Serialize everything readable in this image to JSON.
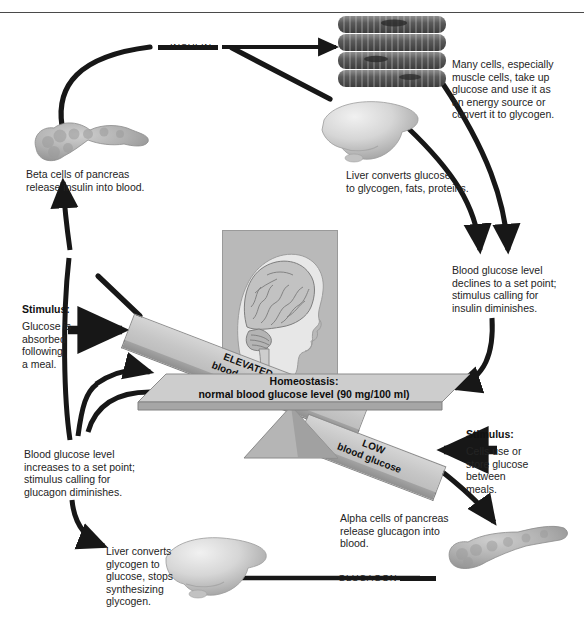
{
  "figure": {
    "top_rule": true
  },
  "hormone_labels": {
    "insulin": "INSULIN",
    "glucagon": "GLUCAGON"
  },
  "balance": {
    "homeostasis_line1": "Homeostasis:",
    "homeostasis_line2": "normal blood glucose level (90 mg/100 ml)",
    "elevated_line1": "ELEVATED",
    "elevated_line2": "blood glucose",
    "low_line1": "LOW",
    "low_line2": "blood glucose",
    "set_point_value": "90 mg/100 ml"
  },
  "stimuli": {
    "top": {
      "heading": "Stimulus:",
      "body": "Glucose is\nabsorbed\nfollowing\na meal."
    },
    "bottom": {
      "heading": "Stimulus:",
      "body": "Cells use or\nstore glucose\nbetween\nmeals."
    }
  },
  "captions": {
    "beta_cells": "Beta cells of pancreas\nrelease insulin into blood.",
    "muscle_uptake": "Many cells, especially\nmuscle cells, take up\nglucose and use it as\nan energy source or\nconvert it to glycogen.",
    "liver_stores": "Liver converts glucose\nto glycogen, fats, proteins.",
    "glucose_declines": "Blood glucose level\ndeclines to a set point;\nstimulus calling for\ninsulin diminishes.",
    "glucose_increases": "Blood glucose level\nincreases to a set point;\nstimulus calling for\nglucagon diminishes.",
    "alpha_cells": "Alpha cells of pancreas\nrelease glucagon into\nblood.",
    "liver_releases": "Liver converts\nglycogen to\nglucose, stops\nsynthesizing\nglycogen."
  },
  "organs": {
    "pancreas_top": "pancreas",
    "pancreas_bottom": "pancreas",
    "liver_top": "liver",
    "liver_bottom": "liver",
    "muscle_fibers": "muscle-cells",
    "brain_head": "human-head-brain"
  },
  "colors": {
    "page_background": "#ffffff",
    "text": "#242424",
    "arrow": "#1a1a1a",
    "beam_face": "#c9c9c9",
    "beam_edge": "#969696",
    "brain_panel": "#b9b9b9",
    "organ_gray": "#a8a8a8",
    "muscle_dark": "#5e5e5e",
    "rule": "#4a4a4a"
  }
}
